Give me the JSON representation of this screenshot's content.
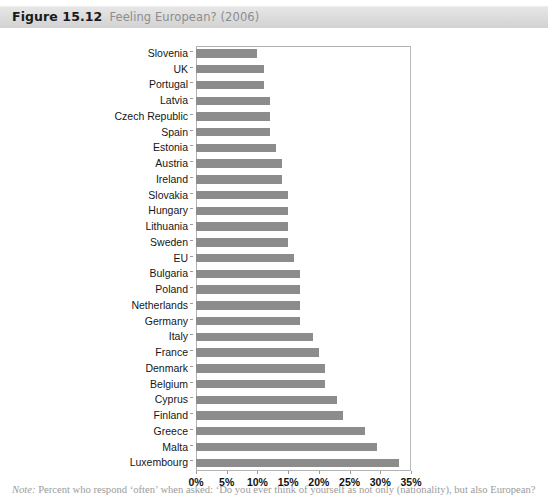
{
  "header": {
    "figure_number": "Figure 15.12",
    "figure_title": "Feeling European? (2006)"
  },
  "note": {
    "lead": "Note:",
    "text": "Percent who respond ‘often’ when asked: ‘Do you ever think of yourself as not only (nationality), but also European?"
  },
  "colors": {
    "bar": "#8c8c8c",
    "header_band": "#dddddd",
    "figure_number_text": "#1a1a1a",
    "figure_title_text": "#8d8d8d",
    "note_text": "#9b9b9b",
    "plot_border": "#b3b3b3"
  },
  "chart_data": {
    "type": "bar",
    "orientation": "horizontal",
    "title": "Feeling European? (2006)",
    "xlabel": "",
    "ylabel": "",
    "xlim": [
      0,
      35
    ],
    "xticks": [
      0,
      5,
      10,
      15,
      20,
      25,
      30,
      35
    ],
    "xtick_labels": [
      "0%",
      "5%",
      "10%",
      "15%",
      "20%",
      "25%",
      "30%",
      "35%"
    ],
    "grid": false,
    "legend": null,
    "categories": [
      "Slovenia",
      "UK",
      "Portugal",
      "Latvia",
      "Czech Republic",
      "Spain",
      "Estonia",
      "Austria",
      "Ireland",
      "Slovakia",
      "Hungary",
      "Lithuania",
      "Sweden",
      "EU",
      "Bulgaria",
      "Poland",
      "Netherlands",
      "Germany",
      "Italy",
      "France",
      "Denmark",
      "Belgium",
      "Cyprus",
      "Finland",
      "Greece",
      "Malta",
      "Luxembourg"
    ],
    "values": [
      10,
      11,
      11,
      12,
      12,
      12,
      13,
      14,
      14,
      15,
      15,
      15,
      15,
      16,
      17,
      17,
      17,
      17,
      19,
      20,
      21,
      21,
      23,
      24,
      27.5,
      29.5,
      33
    ],
    "value_unit": "%"
  }
}
